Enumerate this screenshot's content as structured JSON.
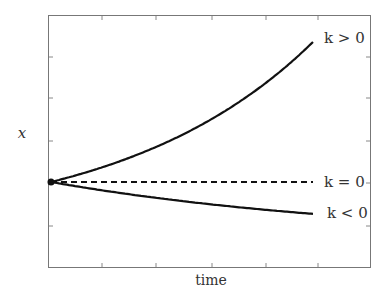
{
  "chart_data": {
    "type": "line",
    "title": "",
    "xlabel": "time",
    "ylabel": "x",
    "grid": false,
    "legend": "inline labels at curve ends",
    "x": [
      0,
      0.2,
      0.4,
      0.6,
      0.8,
      1.0
    ],
    "series": [
      {
        "name": "k > 0",
        "style": "solid",
        "values": [
          0,
          0.11,
          0.25,
          0.42,
          0.66,
          1.0
        ]
      },
      {
        "name": "k = 0",
        "style": "dashed",
        "values": [
          0,
          0,
          0,
          0,
          0,
          0
        ]
      },
      {
        "name": "k < 0",
        "style": "solid",
        "values": [
          0,
          -0.05,
          -0.09,
          -0.13,
          -0.17,
          -0.23
        ]
      }
    ],
    "initial_point": {
      "x": 0,
      "y": 0
    },
    "annotations": [
      "k > 0",
      "k = 0",
      "k < 0"
    ]
  },
  "labels": {
    "x_axis": "time",
    "y_axis": "x",
    "k_pos": "k > 0",
    "k_zero": "k = 0",
    "k_neg": "k < 0"
  }
}
